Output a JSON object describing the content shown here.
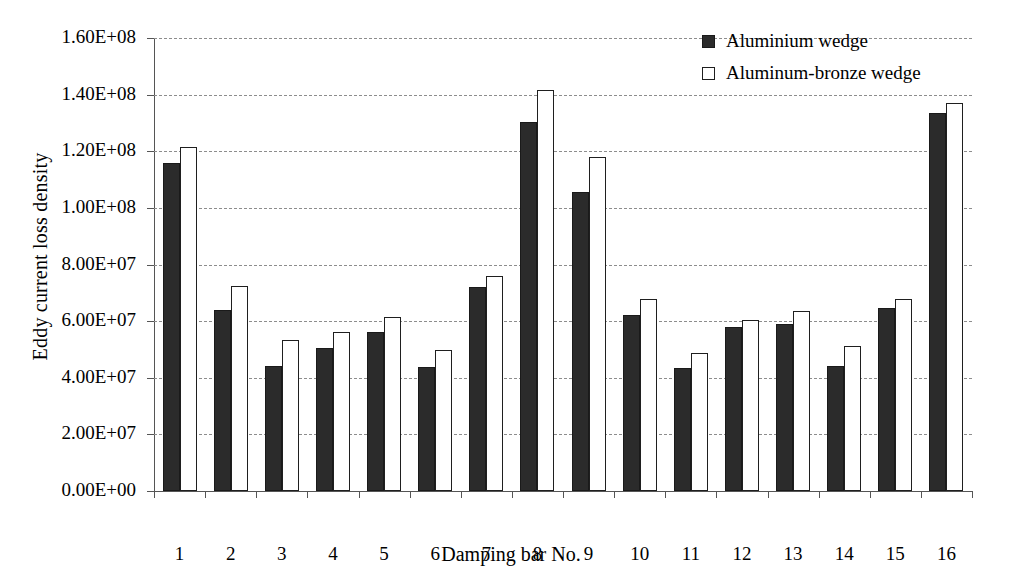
{
  "chart_data": {
    "type": "bar",
    "title": "",
    "xlabel": "Damping bar No.",
    "ylabel": "Eddy current loss density",
    "categories": [
      "1",
      "2",
      "3",
      "4",
      "5",
      "6",
      "7",
      "8",
      "9",
      "10",
      "11",
      "12",
      "13",
      "14",
      "15",
      "16"
    ],
    "ylim": [
      0,
      160000000
    ],
    "ytick_values": [
      0,
      20000000,
      40000000,
      60000000,
      80000000,
      100000000,
      120000000,
      140000000,
      160000000
    ],
    "ytick_labels": [
      "0.00E+00",
      "2.00E+07",
      "4.00E+07",
      "6.00E+07",
      "8.00E+07",
      "1.00E+08",
      "1.20E+08",
      "1.40E+08",
      "1.60E+08"
    ],
    "grid": true,
    "grid_style": "dashed-horizontal",
    "legend_position": "top-right",
    "series": [
      {
        "name": "Aluminium wedge",
        "color": "#2b2b2b",
        "fill": "solid",
        "values": [
          116000000,
          64000000,
          44000000,
          50500000,
          56000000,
          43800000,
          72000000,
          130500000,
          105500000,
          62000000,
          43500000,
          58000000,
          59000000,
          44300000,
          64500000,
          133500000
        ]
      },
      {
        "name": "Aluminum-bronze wedge",
        "color": "#ffffff",
        "fill": "open",
        "values": [
          121500000,
          72300000,
          53500000,
          56000000,
          61500000,
          49800000,
          76000000,
          141500000,
          118000000,
          67800000,
          48800000,
          60500000,
          63500000,
          51300000,
          67800000,
          137000000
        ]
      }
    ]
  },
  "legend": {
    "items": [
      {
        "label": "Aluminium wedge",
        "swatch": "filled-square"
      },
      {
        "label": "Aluminum-bronze wedge",
        "swatch": "open-square"
      }
    ]
  },
  "axes": {
    "y_title": "Eddy current loss density",
    "x_title": "Damping bar No."
  }
}
